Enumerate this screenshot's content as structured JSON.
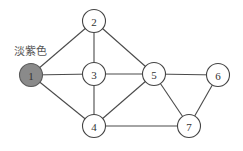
{
  "graph": {
    "annotation": "淡紫色",
    "highlight_color": "#8a8a8a",
    "nodes": [
      {
        "id": "1",
        "label": "1",
        "x": 31,
        "y": 75,
        "filled": true
      },
      {
        "id": "2",
        "label": "2",
        "x": 94,
        "y": 21,
        "filled": false
      },
      {
        "id": "3",
        "label": "3",
        "x": 94,
        "y": 74,
        "filled": false
      },
      {
        "id": "4",
        "label": "4",
        "x": 94,
        "y": 126,
        "filled": false
      },
      {
        "id": "5",
        "label": "5",
        "x": 154,
        "y": 74,
        "filled": false
      },
      {
        "id": "6",
        "label": "6",
        "x": 218,
        "y": 75,
        "filled": false
      },
      {
        "id": "7",
        "label": "7",
        "x": 189,
        "y": 126,
        "filled": false
      }
    ],
    "edges": [
      [
        "1",
        "2"
      ],
      [
        "1",
        "3"
      ],
      [
        "1",
        "4"
      ],
      [
        "2",
        "3"
      ],
      [
        "2",
        "5"
      ],
      [
        "3",
        "5"
      ],
      [
        "3",
        "4"
      ],
      [
        "4",
        "5"
      ],
      [
        "4",
        "7"
      ],
      [
        "5",
        "6"
      ],
      [
        "5",
        "7"
      ],
      [
        "6",
        "7"
      ]
    ]
  }
}
